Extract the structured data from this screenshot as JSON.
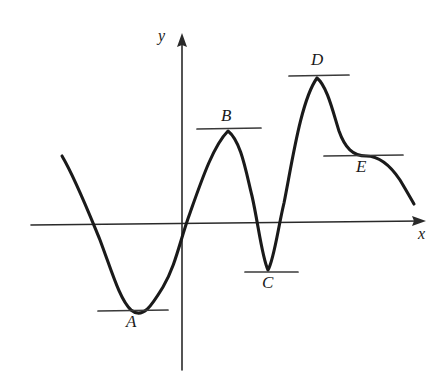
{
  "figure": {
    "background_color": "#ffffff",
    "curve_color": "#1a1a1a",
    "axis_color": "#2a2a2a",
    "tangent_color": "#3a3a3a"
  },
  "axes": {
    "x_label": "x",
    "y_label": "y",
    "origin": {
      "x": 182,
      "y": 223
    },
    "x_axis": {
      "start_x": 31,
      "end_x": 426,
      "y": 223,
      "arrow": "right"
    },
    "y_axis": {
      "x": 182,
      "start_y": 370,
      "end_y": 33,
      "arrow": "up"
    },
    "x_label_pos": {
      "x": 418,
      "y": 226
    },
    "y_label_pos": {
      "x": 158,
      "y": 28
    }
  },
  "labels": [
    {
      "id": "A",
      "text": "A",
      "x": 126,
      "y": 313,
      "kind": "local-minimum"
    },
    {
      "id": "B",
      "text": "B",
      "x": 221,
      "y": 107,
      "kind": "local-maximum"
    },
    {
      "id": "C",
      "text": "C",
      "x": 262,
      "y": 274,
      "kind": "local-minimum"
    },
    {
      "id": "D",
      "text": "D",
      "x": 311,
      "y": 51,
      "kind": "local-maximum"
    },
    {
      "id": "E",
      "text": "E",
      "x": 356,
      "y": 158,
      "kind": "inflection-plateau"
    }
  ],
  "tangents": [
    {
      "id": "A",
      "x1": 98,
      "x2": 168,
      "y": 310
    },
    {
      "id": "B",
      "x1": 197,
      "x2": 261,
      "y": 128
    },
    {
      "id": "C",
      "x1": 245,
      "x2": 298,
      "y": 272
    },
    {
      "id": "D",
      "x1": 289,
      "x2": 349,
      "y": 75
    },
    {
      "id": "E",
      "x1": 324,
      "x2": 403,
      "y": 155
    }
  ],
  "chart_data": {
    "type": "line",
    "xlabel": "x",
    "ylabel": "y",
    "grid": false,
    "legend": false,
    "annotations": [
      {
        "label": "A",
        "role": "local minimum",
        "point_px": [
          130,
          310
        ]
      },
      {
        "label": "B",
        "role": "local maximum",
        "point_px": [
          228,
          130
        ]
      },
      {
        "label": "C",
        "role": "local minimum",
        "point_px": [
          268,
          271
        ]
      },
      {
        "label": "D",
        "role": "local maximum",
        "point_px": [
          317,
          78
        ]
      },
      {
        "label": "E",
        "role": "stationary inflection",
        "point_px": [
          366,
          156
        ]
      }
    ],
    "x_axis_crossings_px": [
      85,
      182,
      247,
      289
    ],
    "curve_endpoints_px": [
      [
        62,
        156
      ],
      [
        414,
        204
      ]
    ],
    "curve_path": "M 62,156 C 75,178 86,206 100,240 C 112,272 120,300 131,310 C 143,320 152,305 163,287 C 176,265 180,240 190,213 C 201,182 213,146 228,131 C 241,141 246,172 252,196 C 258,222 262,258 268,270 C 274,260 278,228 284,203 C 292,163 301,100 317,78 C 327,86 333,112 339,131 C 345,148 353,156 366,156 C 381,156 392,168 400,180 C 406,190 410,197 414,204"
  }
}
